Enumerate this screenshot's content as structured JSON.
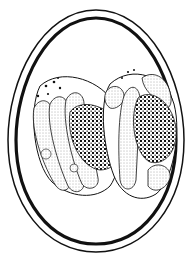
{
  "figure": {
    "background": "#ffffff",
    "ink": "#111111",
    "oocyst": {
      "cx": 96,
      "cy": 131,
      "outer_rx": 86,
      "outer_ry": 122,
      "inner_rx": 78,
      "inner_ry": 113
    },
    "sporocysts": [
      {
        "name": "left-sporocyst",
        "cx": 68,
        "cy": 136,
        "rx": 40,
        "ry": 58,
        "rotate": -28
      },
      {
        "name": "right-sporocyst",
        "cx": 134,
        "cy": 130,
        "rx": 40,
        "ry": 58,
        "rotate": -28
      }
    ]
  }
}
